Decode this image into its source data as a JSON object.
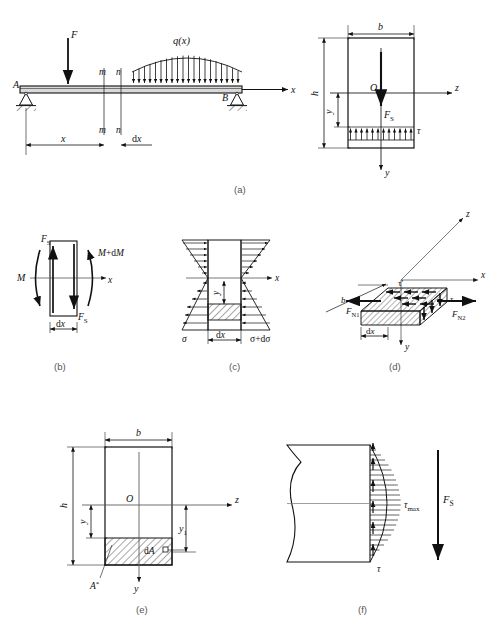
{
  "figure": {
    "captions": [
      {
        "id": "a",
        "label": "(a)"
      },
      {
        "id": "b",
        "label": "(b)"
      },
      {
        "id": "c",
        "label": "(c)"
      },
      {
        "id": "d",
        "label": "(d)"
      },
      {
        "id": "e",
        "label": "(e)"
      },
      {
        "id": "f",
        "label": "(f)"
      }
    ]
  },
  "panel_a": {
    "name": "simply-supported-beam-with-loads",
    "labels": {
      "point_load": "F",
      "distributed_load": "q(x)",
      "support_left": "A",
      "support_right": "B",
      "axis_x": "x",
      "section_m_top": "m",
      "section_n_top": "n",
      "section_m_bottom": "m",
      "section_n_bottom": "n",
      "dim_x": "x",
      "dim_dx": "dx"
    }
  },
  "panel_a_right": {
    "name": "cross-section-shear-distribution",
    "labels": {
      "width": "b",
      "height": "h",
      "depth_y": "y",
      "centroid": "O",
      "shear_force": "F",
      "shear_force_sub": "S",
      "shear_stress": "τ",
      "axis_z": "z",
      "axis_y": "y"
    }
  },
  "panel_b": {
    "name": "beam-element-internal-forces",
    "labels": {
      "moment_left": "M",
      "moment_right": "M+dM",
      "shear_top": "F",
      "shear_top_sub": "S",
      "shear_bottom": "F",
      "shear_bottom_sub": "S",
      "axis_x": "x",
      "dim_dx": "dx"
    }
  },
  "panel_c": {
    "name": "normal-stress-distribution-element",
    "labels": {
      "stress_left": "σ",
      "stress_right": "σ+dσ",
      "dim_dx": "dx",
      "depth_y": "y",
      "axis_x": "x"
    }
  },
  "panel_d": {
    "name": "isolated-block-equilibrium-3d",
    "labels": {
      "normal_force_1": "F",
      "normal_force_1_sub": "N1",
      "normal_force_2": "F",
      "normal_force_2_sub": "N2",
      "shear_stress_top": "τ'",
      "shear_stress_side": "τ",
      "width_b": "b",
      "dim_dx": "dx",
      "axis_x": "x",
      "axis_y": "y",
      "axis_z": "z"
    }
  },
  "panel_e": {
    "name": "cross-section-static-moment-area",
    "labels": {
      "width": "b",
      "height": "h",
      "depth_y": "y",
      "depth_y1": "y",
      "depth_y1_sub": "1",
      "centroid": "O",
      "area_star": "A",
      "area_star_sup": "*",
      "element_area": "dA",
      "axis_z": "z",
      "axis_y": "y"
    }
  },
  "panel_f": {
    "name": "parabolic-shear-stress-diagram",
    "labels": {
      "tau_max": "τ",
      "tau_max_sub": "max",
      "tau": "τ",
      "shear_force": "F",
      "shear_force_sub": "S"
    }
  },
  "colors": {
    "line": "#111111",
    "thin": "#444444",
    "caption": "#555555",
    "hatch": "#222222",
    "fill": "#ffffff"
  }
}
